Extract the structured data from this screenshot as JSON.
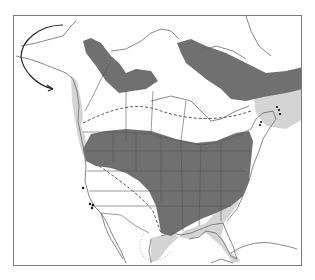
{
  "map": {
    "title": "",
    "region": "North America",
    "type": "species range map",
    "colors": {
      "background": "#ffffff",
      "frame": "#7a7a7a",
      "coast_line": "#6a6a6a",
      "border_line": "#555555",
      "breeding_range": "#707070",
      "winter_range": "#d4d4d4",
      "dashed_boundary": "#5a5a5a",
      "migration_arrow": "#222222",
      "dots": "#111111"
    },
    "legend": [
      {
        "key": "dark-gray",
        "label": "breeding range"
      },
      {
        "key": "light-gray",
        "label": "winter range"
      },
      {
        "key": "dashed-line",
        "label": "range boundary"
      },
      {
        "key": "dotted-line",
        "label": "range boundary (dotted)"
      },
      {
        "key": "arrow",
        "label": "migration route"
      },
      {
        "key": "dots",
        "label": "isolated records"
      }
    ]
  }
}
